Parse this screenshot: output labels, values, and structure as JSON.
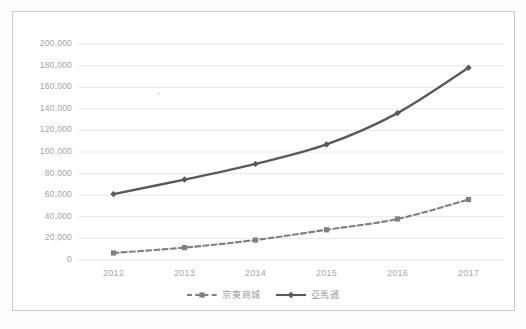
{
  "chart_data": {
    "type": "line",
    "title": "",
    "subtitle": "",
    "xlabel": "",
    "ylabel": "",
    "categories": [
      "2012",
      "2013",
      "2014",
      "2015",
      "2016",
      "2017"
    ],
    "x": [
      2012,
      2013,
      2014,
      2015,
      2016,
      2017
    ],
    "series": [
      {
        "name": "京東商城",
        "values": [
          6500,
          11500,
          18500,
          28000,
          38000,
          56000
        ],
        "color": "#808080",
        "line_style": "dashed",
        "marker": "square"
      },
      {
        "name": "亞馬遜",
        "values": [
          61000,
          74500,
          89000,
          107000,
          136000,
          178000
        ],
        "color": "#595959",
        "line_style": "solid",
        "marker": "diamond"
      }
    ],
    "ylim": [
      0,
      200000
    ],
    "ytick_step": 20000,
    "ytick_labels": [
      "0",
      "20,000",
      "40,000",
      "60,000",
      "80,000",
      "100,000",
      "120,000",
      "140,000",
      "160,000",
      "180,000",
      "200,000"
    ],
    "ytick_values": [
      0,
      20000,
      40000,
      60000,
      80000,
      100000,
      120000,
      140000,
      160000,
      180000,
      200000
    ],
    "grid": true,
    "grid_axis": "y",
    "grid_color": "#e8e8e8",
    "legend_position": "bottom",
    "plot_background": "#ffffff",
    "axis_label_color": "#a3a3a3"
  },
  "figure": {
    "border_color": "#c9c9c9",
    "background": "#fdfdfd"
  },
  "legend": {
    "entries": [
      {
        "label": "京東商城"
      },
      {
        "label": "亞馬遜"
      }
    ]
  }
}
